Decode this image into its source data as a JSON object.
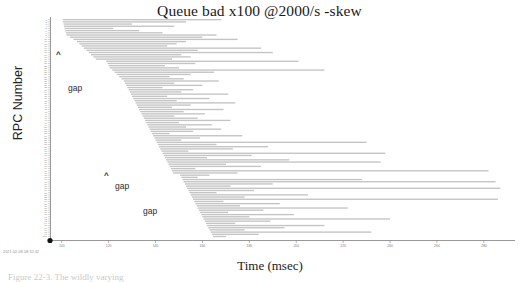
{
  "title": "Queue bad x100 @2000/s -skew",
  "timestamp": "2021-02-08 08:32:42",
  "caption": "Figure 22-3.  The wildly varying",
  "axes": {
    "x_label": "Time (msec)",
    "y_label": "RPC Number"
  },
  "annotations": [
    {
      "name": "caret-1",
      "text": "^",
      "x": 56,
      "y": 50
    },
    {
      "name": "gap-label-1",
      "text": "gap",
      "x": 68,
      "y": 83
    },
    {
      "name": "caret-2",
      "text": "^",
      "x": 104,
      "y": 171
    },
    {
      "name": "gap-label-2",
      "text": "gap",
      "x": 115,
      "y": 181
    },
    {
      "name": "gap-label-3",
      "text": "gap",
      "x": 143,
      "y": 206
    }
  ],
  "chart_data": {
    "type": "bar",
    "orientation": "horizontal",
    "title": "Queue bad x100 @2000/s -skew",
    "xlabel": "Time (msec)",
    "ylabel": "RPC Number",
    "xlim": [
      95,
      292
    ],
    "ylim": [
      0,
      100
    ],
    "grid": false,
    "legend": null,
    "bar_color": "#c4c4c4",
    "axis_color": "#7d7d7d",
    "xticks": [
      100,
      120,
      140,
      160,
      180,
      200,
      220,
      240,
      260,
      280
    ],
    "xtick_labels": [
      "100",
      "120",
      "140",
      "160",
      "180",
      "200",
      "220",
      "240",
      "260",
      "280"
    ],
    "yticks": [
      1,
      10,
      20,
      30,
      40,
      50,
      60,
      70,
      80,
      90,
      100
    ],
    "note": "Each row is one RPC drawn as a horizontal span from its start time to its end time, in msec. Rows are ordered by RPC number top to bottom.",
    "spans": [
      {
        "rpc": 1,
        "start": 100.5,
        "end": 168
      },
      {
        "rpc": 2,
        "start": 100.5,
        "end": 153
      },
      {
        "rpc": 3,
        "start": 100.8,
        "end": 130
      },
      {
        "rpc": 4,
        "start": 101.0,
        "end": 148
      },
      {
        "rpc": 5,
        "start": 101.2,
        "end": 122
      },
      {
        "rpc": 6,
        "start": 101.5,
        "end": 133
      },
      {
        "rpc": 7,
        "start": 101.8,
        "end": 143
      },
      {
        "rpc": 8,
        "start": 102.0,
        "end": 166
      },
      {
        "rpc": 9,
        "start": 103.5,
        "end": 160
      },
      {
        "rpc": 10,
        "start": 105.0,
        "end": 175
      },
      {
        "rpc": 11,
        "start": 106.5,
        "end": 153
      },
      {
        "rpc": 12,
        "start": 107.5,
        "end": 149
      },
      {
        "rpc": 13,
        "start": 108.5,
        "end": 145
      },
      {
        "rpc": 14,
        "start": 109.5,
        "end": 185
      },
      {
        "rpc": 15,
        "start": 110.5,
        "end": 158
      },
      {
        "rpc": 16,
        "start": 111.5,
        "end": 190
      },
      {
        "rpc": 17,
        "start": 112.5,
        "end": 151
      },
      {
        "rpc": 18,
        "start": 113.5,
        "end": 155
      },
      {
        "rpc": 19,
        "start": 114.5,
        "end": 147
      },
      {
        "rpc": 20,
        "start": 119.0,
        "end": 201
      },
      {
        "rpc": 21,
        "start": 119.5,
        "end": 157
      },
      {
        "rpc": 22,
        "start": 120.0,
        "end": 144
      },
      {
        "rpc": 23,
        "start": 120.5,
        "end": 150
      },
      {
        "rpc": 24,
        "start": 121.5,
        "end": 212
      },
      {
        "rpc": 25,
        "start": 122.5,
        "end": 165
      },
      {
        "rpc": 26,
        "start": 123.5,
        "end": 155
      },
      {
        "rpc": 27,
        "start": 124.5,
        "end": 146
      },
      {
        "rpc": 28,
        "start": 125.5,
        "end": 152
      },
      {
        "rpc": 29,
        "start": 126.5,
        "end": 167
      },
      {
        "rpc": 30,
        "start": 127.0,
        "end": 148
      },
      {
        "rpc": 31,
        "start": 127.5,
        "end": 160
      },
      {
        "rpc": 32,
        "start": 128.0,
        "end": 143
      },
      {
        "rpc": 33,
        "start": 128.5,
        "end": 156
      },
      {
        "rpc": 34,
        "start": 129.0,
        "end": 151
      },
      {
        "rpc": 35,
        "start": 129.5,
        "end": 171
      },
      {
        "rpc": 36,
        "start": 130.0,
        "end": 145
      },
      {
        "rpc": 37,
        "start": 130.5,
        "end": 163
      },
      {
        "rpc": 38,
        "start": 131.0,
        "end": 149
      },
      {
        "rpc": 39,
        "start": 131.5,
        "end": 174
      },
      {
        "rpc": 40,
        "start": 132.0,
        "end": 155
      },
      {
        "rpc": 41,
        "start": 132.5,
        "end": 147
      },
      {
        "rpc": 42,
        "start": 133.0,
        "end": 169
      },
      {
        "rpc": 43,
        "start": 133.5,
        "end": 152
      },
      {
        "rpc": 44,
        "start": 134.0,
        "end": 161
      },
      {
        "rpc": 45,
        "start": 134.5,
        "end": 148
      },
      {
        "rpc": 46,
        "start": 135.0,
        "end": 158
      },
      {
        "rpc": 47,
        "start": 135.5,
        "end": 172
      },
      {
        "rpc": 48,
        "start": 136.0,
        "end": 150
      },
      {
        "rpc": 49,
        "start": 136.5,
        "end": 164
      },
      {
        "rpc": 50,
        "start": 137.0,
        "end": 153
      },
      {
        "rpc": 51,
        "start": 137.5,
        "end": 168
      },
      {
        "rpc": 52,
        "start": 138.0,
        "end": 156
      },
      {
        "rpc": 53,
        "start": 138.5,
        "end": 146
      },
      {
        "rpc": 54,
        "start": 139.0,
        "end": 177
      },
      {
        "rpc": 55,
        "start": 139.5,
        "end": 159
      },
      {
        "rpc": 56,
        "start": 140.0,
        "end": 151
      },
      {
        "rpc": 57,
        "start": 140.5,
        "end": 230
      },
      {
        "rpc": 58,
        "start": 141.0,
        "end": 166
      },
      {
        "rpc": 59,
        "start": 141.5,
        "end": 188
      },
      {
        "rpc": 60,
        "start": 142.0,
        "end": 173
      },
      {
        "rpc": 61,
        "start": 142.5,
        "end": 154
      },
      {
        "rpc": 62,
        "start": 143.0,
        "end": 238
      },
      {
        "rpc": 63,
        "start": 143.5,
        "end": 181
      },
      {
        "rpc": 64,
        "start": 144.0,
        "end": 162
      },
      {
        "rpc": 65,
        "start": 144.5,
        "end": 197
      },
      {
        "rpc": 66,
        "start": 145.0,
        "end": 236
      },
      {
        "rpc": 67,
        "start": 145.5,
        "end": 170
      },
      {
        "rpc": 68,
        "start": 146.0,
        "end": 185
      },
      {
        "rpc": 69,
        "start": 146.5,
        "end": 157
      },
      {
        "rpc": 70,
        "start": 147.0,
        "end": 282
      },
      {
        "rpc": 71,
        "start": 147.5,
        "end": 175
      },
      {
        "rpc": 72,
        "start": 150.5,
        "end": 163
      },
      {
        "rpc": 73,
        "start": 151.0,
        "end": 158
      },
      {
        "rpc": 74,
        "start": 151.5,
        "end": 228
      },
      {
        "rpc": 75,
        "start": 152.0,
        "end": 285
      },
      {
        "rpc": 76,
        "start": 152.5,
        "end": 190
      },
      {
        "rpc": 77,
        "start": 153.0,
        "end": 172
      },
      {
        "rpc": 78,
        "start": 153.5,
        "end": 287
      },
      {
        "rpc": 79,
        "start": 154.0,
        "end": 182
      },
      {
        "rpc": 80,
        "start": 154.5,
        "end": 166
      },
      {
        "rpc": 81,
        "start": 155.0,
        "end": 205
      },
      {
        "rpc": 82,
        "start": 155.5,
        "end": 178
      },
      {
        "rpc": 83,
        "start": 156.0,
        "end": 286
      },
      {
        "rpc": 84,
        "start": 156.5,
        "end": 169
      },
      {
        "rpc": 85,
        "start": 157.0,
        "end": 193
      },
      {
        "rpc": 86,
        "start": 157.5,
        "end": 176
      },
      {
        "rpc": 87,
        "start": 158.0,
        "end": 222
      },
      {
        "rpc": 88,
        "start": 158.5,
        "end": 186
      },
      {
        "rpc": 89,
        "start": 159.0,
        "end": 171
      },
      {
        "rpc": 90,
        "start": 159.5,
        "end": 199
      },
      {
        "rpc": 91,
        "start": 160.0,
        "end": 180
      },
      {
        "rpc": 92,
        "start": 160.5,
        "end": 240
      },
      {
        "rpc": 93,
        "start": 161.0,
        "end": 189
      },
      {
        "rpc": 94,
        "start": 161.5,
        "end": 174
      },
      {
        "rpc": 95,
        "start": 162.0,
        "end": 212
      },
      {
        "rpc": 96,
        "start": 162.5,
        "end": 195
      },
      {
        "rpc": 97,
        "start": 163.0,
        "end": 178
      },
      {
        "rpc": 98,
        "start": 163.5,
        "end": 232
      },
      {
        "rpc": 99,
        "start": 164.0,
        "end": 184
      },
      {
        "rpc": 100,
        "start": 164.5,
        "end": 170
      }
    ]
  }
}
